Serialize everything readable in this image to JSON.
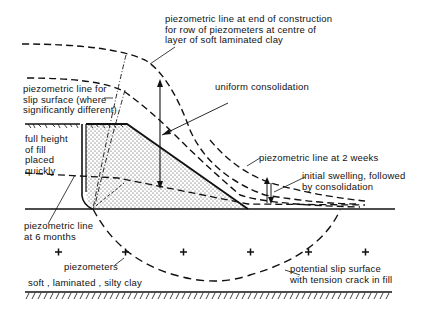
{
  "diagram": {
    "type": "geotechnical cross-section",
    "labels": {
      "end_of_construction": "piezometric line at end of construction\nfor row of piezometers at centre of\nlayer of soft laminated clay",
      "slip_surface_line": "piezometric line for\nslip surface (where\nsignificantly different)",
      "uniform_consolidation": "uniform consolidation",
      "full_height": "full height\nof fill\nplaced\nquickly",
      "two_weeks": "piezometric line at 2 weeks",
      "initial_swelling": "initial swelling, followed\nby consolidation",
      "six_months": "piezometric line\nat 6 months",
      "piezometers": "piezometers",
      "soil": "soft , laminated , silty clay",
      "potential_slip": "potential slip surface\nwith tension crack in fill"
    },
    "piezometer_symbol": "+",
    "piezometer_count": 6,
    "colors": {
      "line": "#111111",
      "background": "#ffffff"
    }
  }
}
